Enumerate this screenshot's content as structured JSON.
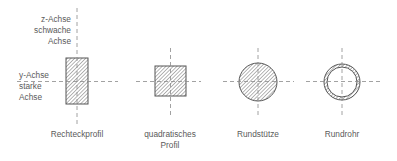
{
  "colors": {
    "line": "#6e6e6e",
    "axis": "#8a8a8a",
    "hatch": "#8c8c8c",
    "text": "#5a5a5a",
    "background": "#ffffff"
  },
  "axis_labels": {
    "z_axis": [
      "z-Achse",
      "schwache",
      "Achse"
    ],
    "y_axis": [
      "y-Achse",
      "starke",
      "Achse"
    ]
  },
  "profiles": [
    {
      "id": "rechteckprofil",
      "shape": "rectangle",
      "label_lines": [
        "Rechteckprofil"
      ]
    },
    {
      "id": "quadratisches-profil",
      "shape": "square",
      "label_lines": [
        "quadratisches",
        "Profil"
      ]
    },
    {
      "id": "rundstuetze",
      "shape": "solid-circle",
      "label_lines": [
        "Rundstütze"
      ]
    },
    {
      "id": "rundrohr",
      "shape": "hollow-circle",
      "label_lines": [
        "Rundrohr"
      ]
    }
  ]
}
